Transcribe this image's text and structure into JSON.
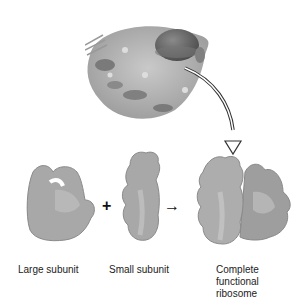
{
  "diagram": {
    "labels": {
      "large_subunit": "Large subunit",
      "small_subunit": "Small subunit",
      "complete_line1": "Complete",
      "complete_line2": "functional",
      "complete_line3": "ribosome"
    },
    "symbols": {
      "plus": "+",
      "arrow": "→"
    },
    "colors": {
      "subunit_fill": "#a8a8a8",
      "subunit_shade": "#888888",
      "cell_fill": "#b5b5b5",
      "nucleus": "#6a6a6a"
    }
  }
}
